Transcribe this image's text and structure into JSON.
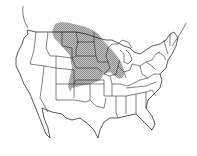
{
  "map": {
    "type": "range-map",
    "region": "United States (contiguous)",
    "shaded_region": {
      "description": "Northern Great Plains and Midwest, extending north into Canada",
      "fill_color": "#9a9a9a",
      "states_covered": [
        "Montana (east)",
        "North Dakota",
        "South Dakota",
        "Nebraska",
        "Kansas",
        "Iowa",
        "Minnesota",
        "Wisconsin (west)",
        "Illinois (part)",
        "Missouri (north)",
        "Wyoming (east)",
        "Colorado (east)",
        "Oklahoma (north)"
      ]
    },
    "line_color": "#1a1a1a",
    "background": "#ffffff"
  }
}
